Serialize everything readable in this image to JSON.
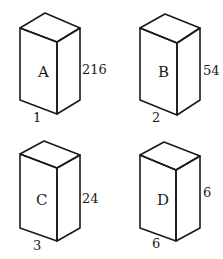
{
  "diagram": {
    "type": "rectangular prisms comparison",
    "boxes": [
      {
        "id": "A",
        "label": "A",
        "height_label": "216",
        "base_label": "1",
        "vertices": {
          "apex": [
            45,
            13
          ],
          "left_top": [
            20,
            28
          ],
          "front_top": [
            57,
            42
          ],
          "right_top": [
            80,
            28
          ],
          "left_bottom": [
            20,
            100
          ],
          "front_bottom": [
            57,
            114
          ],
          "right_bottom": [
            80,
            100
          ]
        },
        "label_pos": [
          38,
          77
        ],
        "height_pos": [
          82,
          74
        ],
        "base_pos": [
          33,
          122
        ]
      },
      {
        "id": "B",
        "label": "B",
        "height_label": "54",
        "base_label": "2",
        "vertices": {
          "apex": [
            165,
            14
          ],
          "left_top": [
            140,
            28
          ],
          "front_top": [
            177,
            43
          ],
          "right_top": [
            200,
            28
          ],
          "left_bottom": [
            140,
            100
          ],
          "front_bottom": [
            177,
            115
          ],
          "right_bottom": [
            200,
            100
          ]
        },
        "label_pos": [
          158,
          77
        ],
        "height_pos": [
          203,
          75
        ],
        "base_pos": [
          152,
          122
        ]
      },
      {
        "id": "C",
        "label": "C",
        "height_label": "24",
        "base_label": "3",
        "vertices": {
          "apex": [
            44,
            141
          ],
          "left_top": [
            20,
            154
          ],
          "front_top": [
            57,
            168
          ],
          "right_top": [
            80,
            155
          ],
          "left_bottom": [
            20,
            228
          ],
          "front_bottom": [
            57,
            241
          ],
          "right_bottom": [
            80,
            228
          ]
        },
        "label_pos": [
          36,
          205
        ],
        "height_pos": [
          82,
          203
        ],
        "base_pos": [
          33,
          250
        ]
      },
      {
        "id": "D",
        "label": "D",
        "height_label": "6",
        "base_label": "6",
        "vertices": {
          "apex": [
            164,
            142
          ],
          "left_top": [
            140,
            155
          ],
          "front_top": [
            176,
            170
          ],
          "right_top": [
            200,
            156
          ],
          "left_bottom": [
            140,
            228
          ],
          "front_bottom": [
            176,
            241
          ],
          "right_bottom": [
            200,
            228
          ]
        },
        "label_pos": [
          157,
          205
        ],
        "height_pos": [
          203,
          197
        ],
        "base_pos": [
          152,
          248
        ]
      }
    ],
    "colors": {
      "stroke": "#1a1a1a",
      "background": "#ffffff"
    }
  }
}
